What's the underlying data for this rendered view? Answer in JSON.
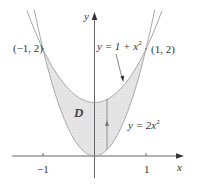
{
  "figure": {
    "type": "region-between-curves",
    "axes": {
      "x_label": "x",
      "y_label": "y",
      "x_ticks": [
        {
          "value": -1,
          "label": "−1"
        },
        {
          "value": 1,
          "label": "1"
        }
      ]
    },
    "curves": [
      {
        "name": "upper",
        "equation_lhs": "y = 1 + x",
        "exponent": "2",
        "formula": "y = 1 + x^2"
      },
      {
        "name": "lower",
        "equation_lhs": "y = 2x",
        "exponent": "2",
        "formula": "y = 2x^2"
      }
    ],
    "points": [
      {
        "label": "(−1, 2)",
        "x": -1,
        "y": 2
      },
      {
        "label": "(1, 2)",
        "x": 1,
        "y": 2
      }
    ],
    "region_label": "D",
    "colors": {
      "region_fill": "#e4e4e4",
      "curve_stroke": "#a8a8a8",
      "axis_stroke": "#555555",
      "text": "#333333"
    }
  }
}
